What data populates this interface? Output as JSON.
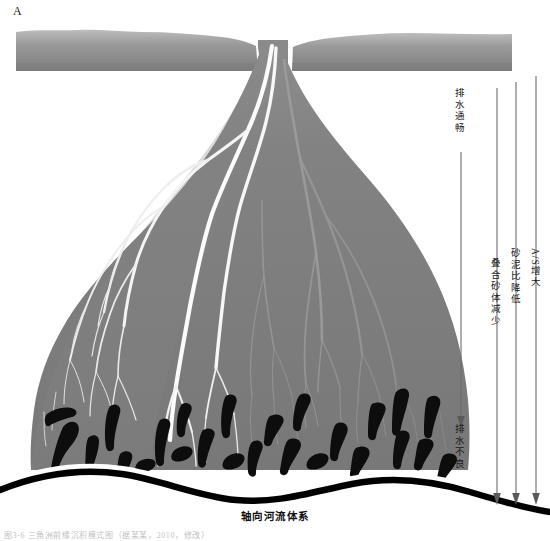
{
  "figure": {
    "panel_letter": "A",
    "axial_caption": "轴向河流体系",
    "bottom_caption": "图3-6 三角洲前缘沉积模式图（据某某，2010，修改）",
    "background_color": "#ffffff",
    "fan_color": "#7b7b7b",
    "feeder_color": "#8a8a8a",
    "channel_color": "#f2f2f2",
    "sandbody_color": "#0d0d0d",
    "axial_river_color": "#000000"
  },
  "annotations": {
    "drainage_top": "排水通畅",
    "drainage_bottom": "排水不良",
    "arrow_labels": [
      {
        "id": "amalgamated",
        "text": "叠合砂体减少"
      },
      {
        "id": "sand_mud_ratio",
        "text": "砂泥比降低"
      },
      {
        "id": "as_ratio",
        "text": "A/S增大"
      }
    ]
  },
  "elements": {
    "feeder_channel_name": "feeder-channel-band",
    "fan_body_name": "delta-fan-body",
    "distributary_network_name": "distributary-channel-network",
    "sand_bodies_name": "isolated-sand-bodies",
    "axial_river_name": "axial-river-belt"
  }
}
